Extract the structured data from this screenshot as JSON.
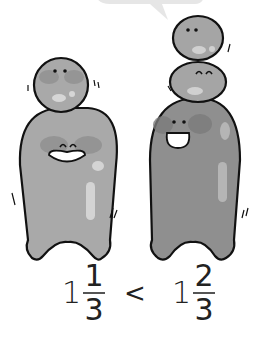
{
  "illustration": {
    "left_figure": {
      "description": "smaller figure: one head ball on body",
      "balls_on_top": 1,
      "body_color": "#a8a8a8"
    },
    "right_figure": {
      "description": "taller figure: two head balls on body",
      "balls_on_top": 2,
      "body_color": "#8f8f8f"
    },
    "speech_bubble": {
      "visible": true,
      "color": "#e6e6e6"
    }
  },
  "comparison": {
    "left": {
      "whole": "1",
      "numerator": "1",
      "denominator": "3"
    },
    "operator": "<",
    "right": {
      "whole": "1",
      "numerator": "2",
      "denominator": "3"
    }
  }
}
